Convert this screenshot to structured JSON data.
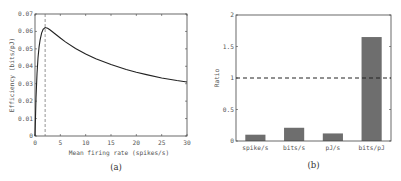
{
  "chart_data": [
    {
      "type": "line",
      "panel_label": "(a)",
      "title": "",
      "xlabel": "Mean firing rate (spikes/s)",
      "ylabel": "Efficiency (bits/pJ)",
      "xlim": [
        0,
        30
      ],
      "ylim": [
        0,
        0.07
      ],
      "xticks": [
        0,
        5,
        10,
        15,
        20,
        25,
        30
      ],
      "yticks": [
        0,
        0.01,
        0.02,
        0.03,
        0.04,
        0.05,
        0.06,
        0.07
      ],
      "ytick_labels": [
        "0",
        "0.01",
        "0.02",
        "0.03",
        "0.04",
        "0.05",
        "0.06",
        "0.07"
      ],
      "grid": false,
      "vline": {
        "x": 2,
        "style": "dashed"
      },
      "series": [
        {
          "name": "efficiency",
          "x": [
            0,
            0.2,
            0.4,
            0.6,
            0.8,
            1.0,
            1.3,
            1.6,
            2.0,
            2.5,
            3,
            4,
            5,
            6,
            8,
            10,
            12,
            15,
            18,
            20,
            22,
            25,
            28,
            30
          ],
          "y": [
            0,
            0.022,
            0.036,
            0.045,
            0.051,
            0.055,
            0.059,
            0.0612,
            0.0622,
            0.0618,
            0.0608,
            0.0585,
            0.0562,
            0.054,
            0.0502,
            0.047,
            0.0443,
            0.041,
            0.0382,
            0.0366,
            0.0352,
            0.0333,
            0.0318,
            0.031
          ]
        }
      ]
    },
    {
      "type": "bar",
      "panel_label": "(b)",
      "title": "",
      "xlabel": "",
      "ylabel": "Ratio",
      "categories": [
        "spike/s",
        "bits/s",
        "pJ/s",
        "bits/pJ"
      ],
      "values": [
        0.1,
        0.21,
        0.12,
        1.65
      ],
      "ylim": [
        0,
        2
      ],
      "yticks": [
        0,
        0.5,
        1,
        1.5,
        2
      ],
      "ytick_labels": [
        "0",
        "0.5",
        "1",
        "1.5",
        "2"
      ],
      "grid": false,
      "hline": {
        "y": 1,
        "style": "dashed"
      },
      "bar_color": "#6e6e6e"
    }
  ]
}
